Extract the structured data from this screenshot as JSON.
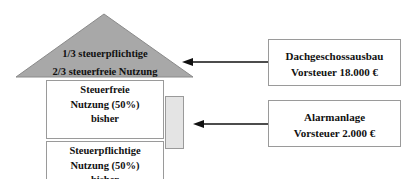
{
  "roof": {
    "line1": "1/3 steuerpflichtige",
    "line2": "2/3 steuerfreie Nutzung",
    "fill_color": "#a8a8a8"
  },
  "rooms": [
    {
      "line1": "Steuerfreie",
      "line2": "Nutzung (50%)",
      "line3": "bisher"
    },
    {
      "line1": "Steuerpflichtige",
      "line2": "Nutzung (50%)",
      "line3": "bisher"
    }
  ],
  "info_boxes": [
    {
      "title": "Dachgeschossausbau",
      "value": "Vorsteuer 18.000 €"
    },
    {
      "title": "Alarmanlage",
      "value": "Vorsteuer 2.000 €"
    }
  ]
}
